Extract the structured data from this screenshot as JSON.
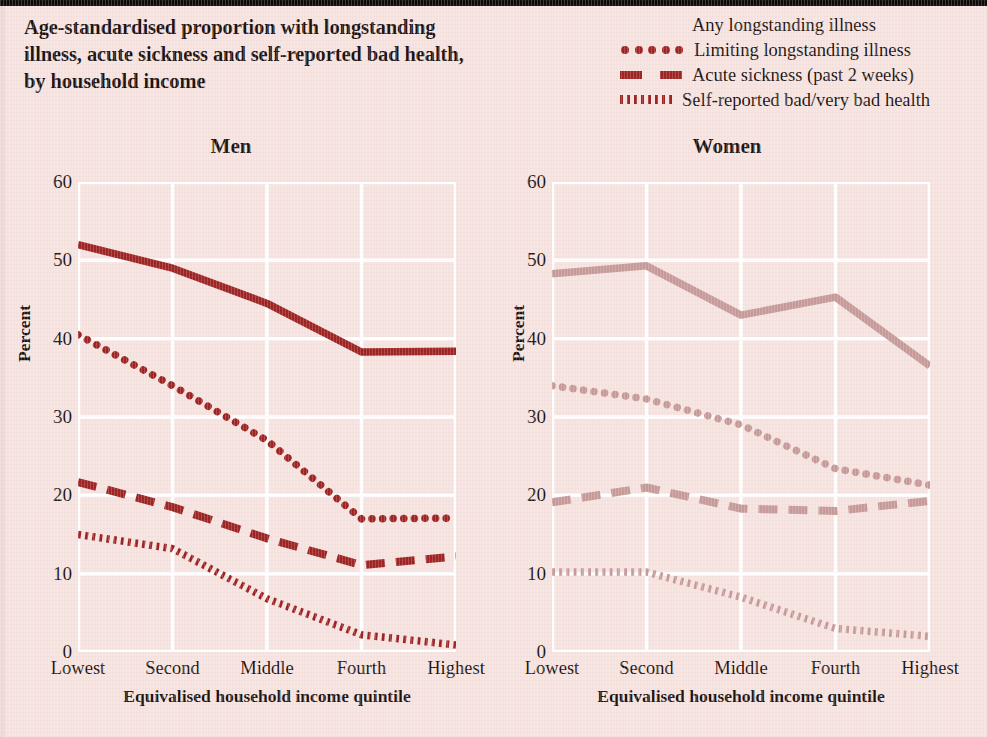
{
  "figure": {
    "title_lines": [
      "Age-standardised proportion with longstanding",
      "illness, acute sickness and self-reported bad health,",
      "by household income"
    ]
  },
  "legend": {
    "position": "top-right",
    "items": [
      {
        "label": "Any longstanding illness",
        "style": "solid",
        "key_icon": "solid-line-key"
      },
      {
        "label": "Limiting longstanding illness",
        "style": "dotted",
        "key_icon": "dotted-line-key"
      },
      {
        "label": "Acute sickness (past 2 weeks)",
        "style": "dashed",
        "key_icon": "dashed-line-key"
      },
      {
        "label": "Self-reported bad/very bad health",
        "style": "fine-dotted",
        "key_icon": "fine-dotted-line-key"
      }
    ]
  },
  "colors": {
    "background": "#f6e3e0",
    "men_series": "#9e2323",
    "women_series": "#c59a98",
    "gridline": "#ffffff",
    "text": "#1b1412",
    "top_bar": "#0d0a09"
  },
  "panels": {
    "men": {
      "title": "Men",
      "ylabel": "Percent",
      "xlabel": "Equivalised household income quintile"
    },
    "women": {
      "title": "Women",
      "ylabel": "Percent",
      "xlabel": "Equivalised household income quintile"
    }
  },
  "axis": {
    "yticks": [
      0,
      10,
      20,
      30,
      40,
      50,
      60
    ],
    "ylim": [
      0,
      60
    ],
    "xticks": [
      "Lowest",
      "Second",
      "Middle",
      "Fourth",
      "Highest"
    ]
  },
  "chart_data": [
    {
      "type": "line",
      "title": "Men",
      "xlabel": "Equivalised household income quintile",
      "ylabel": "Percent",
      "categories": [
        "Lowest",
        "Second",
        "Middle",
        "Fourth",
        "Highest"
      ],
      "ylim": [
        0,
        60
      ],
      "yticks": [
        0,
        10,
        20,
        30,
        40,
        50,
        60
      ],
      "grid": true,
      "color": "#9e2323",
      "series": [
        {
          "name": "Any longstanding illness",
          "style": "solid",
          "values": [
            52,
            49,
            44.5,
            38.3,
            38.4
          ]
        },
        {
          "name": "Limiting longstanding illness",
          "style": "dotted",
          "values": [
            40.5,
            34,
            27,
            17,
            17.1
          ]
        },
        {
          "name": "Acute sickness (past 2 weeks)",
          "style": "dashed",
          "values": [
            21.7,
            18.5,
            14.5,
            11.1,
            12.2
          ]
        },
        {
          "name": "Self-reported bad/very bad health",
          "style": "fine-dotted",
          "values": [
            15,
            13.2,
            6.8,
            2.2,
            0.9
          ]
        }
      ]
    },
    {
      "type": "line",
      "title": "Women",
      "xlabel": "Equivalised household income quintile",
      "ylabel": "Percent",
      "categories": [
        "Lowest",
        "Second",
        "Middle",
        "Fourth",
        "Highest"
      ],
      "ylim": [
        0,
        60
      ],
      "yticks": [
        0,
        10,
        20,
        30,
        40,
        50,
        60
      ],
      "grid": true,
      "color": "#c59a98",
      "series": [
        {
          "name": "Any longstanding illness",
          "style": "solid",
          "values": [
            48.3,
            49.3,
            43,
            45.3,
            36.5
          ]
        },
        {
          "name": "Limiting longstanding illness",
          "style": "dotted",
          "values": [
            34,
            32.3,
            29,
            23.4,
            21.3
          ]
        },
        {
          "name": "Acute sickness (past 2 weeks)",
          "style": "dashed",
          "values": [
            19.1,
            21,
            18.3,
            18,
            19.3
          ]
        },
        {
          "name": "Self-reported bad/very bad health",
          "style": "fine-dotted",
          "values": [
            10.2,
            10.2,
            7,
            3,
            2
          ]
        }
      ]
    }
  ]
}
